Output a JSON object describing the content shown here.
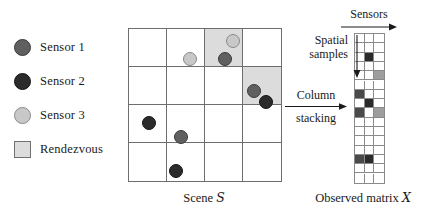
{
  "figure": {
    "legend": {
      "items": [
        {
          "label": "Sensor 1",
          "marker": "filled-circle-dark-gray",
          "color": "#606060",
          "stroke": "#3a3a3a"
        },
        {
          "label": "Sensor 2",
          "marker": "filled-circle-black",
          "color": "#2b2b2b",
          "stroke": "#151515"
        },
        {
          "label": "Sensor 3",
          "marker": "filled-circle-light-gray",
          "color": "#c8c8c8",
          "stroke": "#8a8a8a"
        },
        {
          "label": "Rendezvous",
          "marker": "filled-square-light-gray",
          "color": "#dcdcdc",
          "stroke": "#707070"
        }
      ]
    },
    "scene": {
      "caption_text": "Scene",
      "caption_symbol": "S",
      "rows": 4,
      "cols": 4,
      "cell_size": 38,
      "grid_color": "#6e6e6e",
      "rendezvous_color": "#dcdcdc",
      "rendezvous_cells": [
        {
          "row": 0,
          "col": 2
        },
        {
          "row": 1,
          "col": 3
        }
      ],
      "markers": [
        {
          "sensor": "Sensor 3",
          "x": 104,
          "y": 12,
          "r": 7,
          "color": "#c8c8c8",
          "stroke": "#8a8a8a"
        },
        {
          "sensor": "Sensor 3",
          "x": 61,
          "y": 30,
          "r": 7,
          "color": "#c8c8c8",
          "stroke": "#8a8a8a"
        },
        {
          "sensor": "Sensor 1",
          "x": 96,
          "y": 30,
          "r": 7,
          "color": "#606060",
          "stroke": "#3a3a3a"
        },
        {
          "sensor": "Sensor 1",
          "x": 125,
          "y": 62,
          "r": 7,
          "color": "#606060",
          "stroke": "#3a3a3a"
        },
        {
          "sensor": "Sensor 2",
          "x": 137,
          "y": 73,
          "r": 7,
          "color": "#2b2b2b",
          "stroke": "#151515"
        },
        {
          "sensor": "Sensor 2",
          "x": 20,
          "y": 94,
          "r": 7,
          "color": "#2b2b2b",
          "stroke": "#151515"
        },
        {
          "sensor": "Sensor 1",
          "x": 52,
          "y": 108,
          "r": 7,
          "color": "#606060",
          "stroke": "#3a3a3a"
        },
        {
          "sensor": "Sensor 2",
          "x": 47,
          "y": 142,
          "r": 7,
          "color": "#2b2b2b",
          "stroke": "#151515"
        }
      ]
    },
    "matrix": {
      "caption_text": "Observed matrix",
      "caption_symbol": "X",
      "rows": 16,
      "cols": 3,
      "cell_w": 9.5,
      "cell_h": 9.3,
      "grid_color": "#8a8a8a",
      "empty_color": "#ffffff",
      "colors": {
        "sensor1": "#606060",
        "sensor2": "#2b2b2b",
        "sensor3": "#c8c8c8",
        "empty": "#ffffff"
      },
      "filled_cells": [
        {
          "row": 2,
          "col": 1,
          "color": "#2b2b2b",
          "sensor": "Sensor 2"
        },
        {
          "row": 4,
          "col": 2,
          "color": "#9e9e9e",
          "sensor": "Sensor 3"
        },
        {
          "row": 6,
          "col": 0,
          "color": "#4a4a4a",
          "sensor": "Sensor 1"
        },
        {
          "row": 7,
          "col": 1,
          "color": "#2b2b2b",
          "sensor": "Sensor 2"
        },
        {
          "row": 8,
          "col": 0,
          "color": "#4a4a4a",
          "sensor": "Sensor 1"
        },
        {
          "row": 8,
          "col": 2,
          "color": "#9e9e9e",
          "sensor": "Sensor 3"
        },
        {
          "row": 13,
          "col": 0,
          "color": "#4a4a4a",
          "sensor": "Sensor 1"
        },
        {
          "row": 13,
          "col": 1,
          "color": "#2b2b2b",
          "sensor": "Sensor 2"
        }
      ]
    },
    "annotations": {
      "sensors_label": "Sensors",
      "spatial_label_line1": "Spatial",
      "spatial_label_line2": "samples",
      "column_label_line1": "Column",
      "column_label_line2": "stacking"
    }
  }
}
